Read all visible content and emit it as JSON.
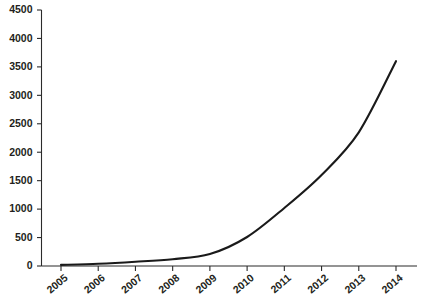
{
  "chart_data": {
    "type": "line",
    "title": "",
    "subtitle": "",
    "xlabel": "",
    "ylabel": "",
    "categories": [
      "2005",
      "2006",
      "2007",
      "2008",
      "2009",
      "2010",
      "2011",
      "2012",
      "2013",
      "2014"
    ],
    "values": [
      20,
      40,
      75,
      120,
      210,
      510,
      1020,
      1600,
      2350,
      3600
    ],
    "series": [
      {
        "name": "",
        "values": [
          20,
          40,
          75,
          120,
          210,
          510,
          1020,
          1600,
          2350,
          3600
        ]
      }
    ],
    "ylim": [
      0,
      4500
    ],
    "yticks": [
      0,
      500,
      1000,
      1500,
      2000,
      2500,
      3000,
      3500,
      4000,
      4500
    ],
    "ytick_labels": [
      "0",
      "500",
      "1000",
      "1500",
      "2000",
      "2500",
      "3000",
      "3500",
      "4000",
      "4500"
    ],
    "grid": false,
    "legend": false,
    "legend_position": "none",
    "line_color": "#1a1a1a",
    "axis_color": "#2b2b2b",
    "label_color": "#231f20",
    "background_color": "#ffffff",
    "xtick_label_rotation": -40
  }
}
